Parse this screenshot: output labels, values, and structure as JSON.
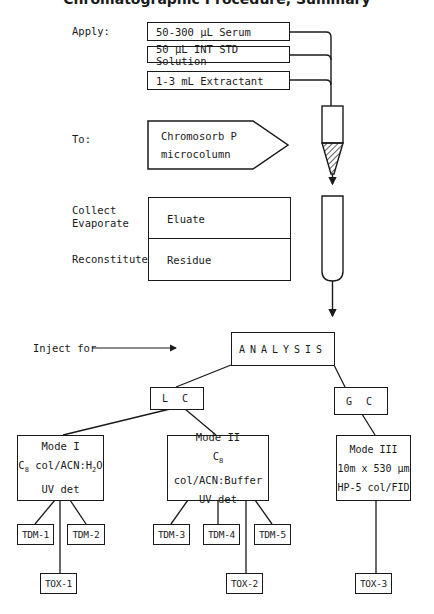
{
  "title_partial": "Chromatographic Procedure, Summary",
  "steps": {
    "apply": {
      "label": "Apply:",
      "items": [
        "50-300 µL Serum",
        "50 µL INT STD Solution",
        "1-3 mL Extractant"
      ]
    },
    "to": {
      "label": "To:",
      "line1": "Chromosorb P",
      "line2": "microcolumn"
    },
    "collect": {
      "label_line1": "Collect",
      "label_line2": "Evaporate",
      "value": "Eluate"
    },
    "reconstitute": {
      "label": "Reconstitute",
      "value": "Residue"
    },
    "inject": {
      "label": "Inject for",
      "target": "ANALYSIS"
    }
  },
  "branches": {
    "lc": {
      "label": "L C",
      "modes": [
        {
          "name": "Mode I",
          "column_prefix": "C",
          "column_sub": "8",
          "column_rest": " col/ACN:H",
          "column_sub2": "2",
          "column_tail": "O",
          "detector": "UV det",
          "tdm": [
            "TDM-1",
            "TDM-2"
          ],
          "tox": "TOX-1"
        },
        {
          "name": "Mode II",
          "column_prefix": "C",
          "column_sub": "8",
          "column_rest": " col/ACN:Buffer",
          "detector": "UV det",
          "tdm": [
            "TDM-3",
            "TDM-4",
            "TDM-5"
          ],
          "tox": "TOX-2"
        }
      ]
    },
    "gc": {
      "label": "G C",
      "modes": [
        {
          "name": "Mode III",
          "line2": "10m x 530 µm",
          "line3": "HP-5 col/FID",
          "tox": "TOX-3"
        }
      ]
    }
  },
  "colors": {
    "ink": "#1a1a1a",
    "background": "#ffffff"
  }
}
